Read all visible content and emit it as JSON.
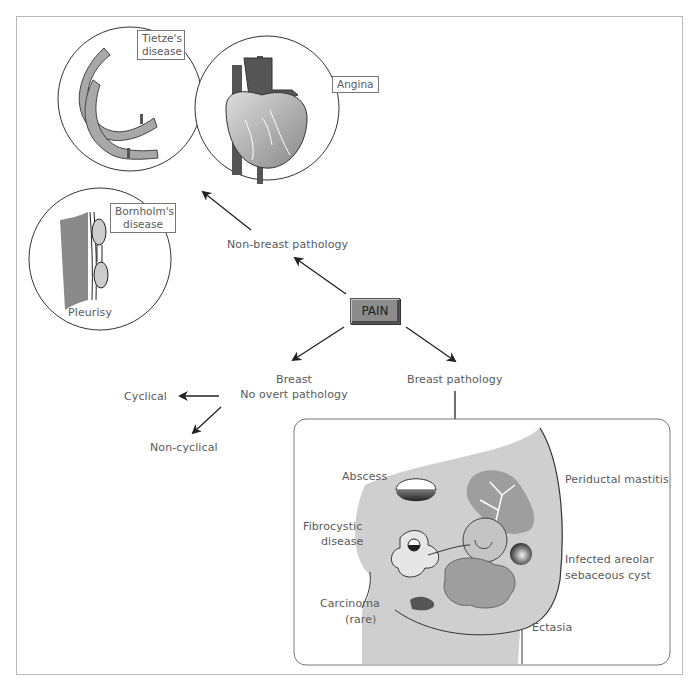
{
  "diagram": {
    "central_node": "PAIN",
    "branches": {
      "non_breast": {
        "label": "Non-breast pathology",
        "conditions": [
          {
            "label": "Tietze's disease",
            "illustration": "ribs"
          },
          {
            "label": "Angina",
            "illustration": "heart"
          },
          {
            "label": "Bornholm's disease",
            "illustration": "pleura"
          },
          {
            "label": "Pleurisy",
            "illustration": "pleura"
          }
        ]
      },
      "no_overt": {
        "label_line1": "Breast",
        "label_line2": "No overt pathology",
        "children": [
          "Cyclical",
          "Non-cyclical"
        ]
      },
      "breast_pathology": {
        "label": "Breast pathology",
        "conditions": {
          "abscess": "Abscess",
          "fibrocystic_line1": "Fibrocystic",
          "fibrocystic_line2": "disease",
          "carcinoma_line1": "Carcinoma",
          "carcinoma_line2": "(rare)",
          "periductal": "Periductal mastitis",
          "infected_line1": "Infected areolar",
          "infected_line2": "sebaceous cyst",
          "ectasia": "Ectasia"
        }
      }
    },
    "colors": {
      "pain_box": "#8c8c8c",
      "breast_fill": "#cfcfcf",
      "vessel_dark": "#555555",
      "line": "#222222",
      "text": "#5a5a5a"
    }
  }
}
